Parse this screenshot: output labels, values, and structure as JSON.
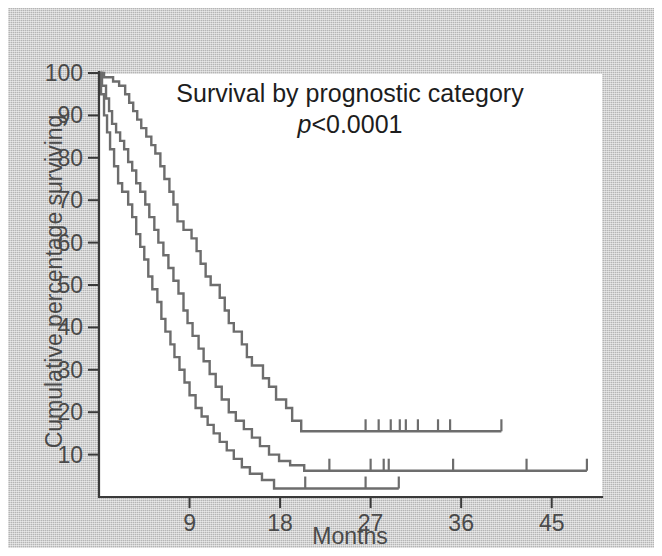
{
  "figure": {
    "background_color": "#b5b5b5",
    "plot_background_color": "#ffffff",
    "curve_color": "#6d6d6d",
    "axis_color": "#3a3a3a"
  },
  "title": {
    "line1": "Survival by prognostic category",
    "p_symbol": "p",
    "p_value": "<0.0001"
  },
  "axes": {
    "x_label": "Months",
    "y_label": "Cumulative percentage surviving",
    "x_ticks": [
      9,
      18,
      27,
      36,
      45
    ],
    "x_tick_labels": [
      "9",
      "18",
      "27",
      "36",
      "45"
    ],
    "y_ticks": [
      10,
      20,
      30,
      40,
      50,
      60,
      70,
      80,
      90,
      100
    ],
    "y_tick_labels": [
      "10",
      "20",
      "30",
      "40",
      "50",
      "60",
      "70",
      "80",
      "90",
      "100"
    ],
    "xlim": [
      0,
      50
    ],
    "ylim": [
      0,
      100
    ]
  },
  "chart_data": {
    "type": "line",
    "title": "Survival by prognostic category",
    "subtitle": "p<0.0001",
    "xlabel": "Months",
    "ylabel": "Cumulative percentage surviving",
    "xlim": [
      0,
      50
    ],
    "ylim": [
      0,
      100
    ],
    "x_ticks": [
      9,
      18,
      27,
      36,
      45
    ],
    "y_ticks": [
      10,
      20,
      30,
      40,
      50,
      60,
      70,
      80,
      90,
      100
    ],
    "grid": false,
    "legend": "none",
    "annotation": "p<0.0001",
    "series": [
      {
        "name": "Good prognostic category",
        "style": "kaplan-meier step",
        "points": [
          [
            0,
            100
          ],
          [
            0.5,
            100
          ],
          [
            0.5,
            99
          ],
          [
            1.4,
            99
          ],
          [
            1.4,
            98
          ],
          [
            2.0,
            98
          ],
          [
            2.0,
            97
          ],
          [
            2.6,
            97
          ],
          [
            2.6,
            95
          ],
          [
            3.0,
            95
          ],
          [
            3.0,
            93
          ],
          [
            3.4,
            93
          ],
          [
            3.4,
            91
          ],
          [
            3.8,
            91
          ],
          [
            3.8,
            89
          ],
          [
            4.2,
            89
          ],
          [
            4.2,
            87
          ],
          [
            4.7,
            87
          ],
          [
            4.7,
            85
          ],
          [
            5.2,
            85
          ],
          [
            5.2,
            83
          ],
          [
            5.6,
            83
          ],
          [
            5.6,
            81
          ],
          [
            6.1,
            81
          ],
          [
            6.1,
            78
          ],
          [
            6.5,
            78
          ],
          [
            6.5,
            75
          ],
          [
            7.0,
            75
          ],
          [
            7.0,
            72
          ],
          [
            7.4,
            72
          ],
          [
            7.4,
            69
          ],
          [
            7.8,
            69
          ],
          [
            7.8,
            65
          ],
          [
            8.4,
            65
          ],
          [
            8.4,
            63
          ],
          [
            9.2,
            63
          ],
          [
            9.2,
            61
          ],
          [
            9.7,
            61
          ],
          [
            9.7,
            58
          ],
          [
            10.1,
            58
          ],
          [
            10.1,
            55
          ],
          [
            10.6,
            55
          ],
          [
            10.6,
            52
          ],
          [
            11.1,
            52
          ],
          [
            11.1,
            50
          ],
          [
            12.0,
            50
          ],
          [
            12.0,
            47
          ],
          [
            12.5,
            47
          ],
          [
            12.5,
            44
          ],
          [
            12.9,
            44
          ],
          [
            12.9,
            41
          ],
          [
            13.4,
            41
          ],
          [
            13.4,
            39
          ],
          [
            14.2,
            39
          ],
          [
            14.2,
            36
          ],
          [
            14.7,
            36
          ],
          [
            14.7,
            33
          ],
          [
            15.2,
            33
          ],
          [
            15.2,
            31
          ],
          [
            16.3,
            31
          ],
          [
            16.3,
            28
          ],
          [
            16.9,
            28
          ],
          [
            16.9,
            26
          ],
          [
            17.6,
            26
          ],
          [
            17.6,
            23
          ],
          [
            18.6,
            23
          ],
          [
            18.6,
            21
          ],
          [
            19.2,
            21
          ],
          [
            19.2,
            18
          ],
          [
            20.1,
            18
          ],
          [
            20.1,
            15.5
          ],
          [
            40.0,
            15.5
          ]
        ],
        "censor_marks": [
          26.5,
          27.8,
          29.0,
          29.9,
          30.5,
          31.7,
          33.7,
          34.9,
          40.0
        ],
        "plateau_value": 15.5,
        "end_month": 40.0
      },
      {
        "name": "Intermediate prognostic category",
        "style": "kaplan-meier step",
        "points": [
          [
            0,
            100
          ],
          [
            0.3,
            100
          ],
          [
            0.3,
            97
          ],
          [
            0.7,
            97
          ],
          [
            0.7,
            94
          ],
          [
            1.0,
            94
          ],
          [
            1.0,
            91
          ],
          [
            1.3,
            91
          ],
          [
            1.3,
            88
          ],
          [
            1.7,
            88
          ],
          [
            1.7,
            86
          ],
          [
            2.1,
            86
          ],
          [
            2.1,
            84
          ],
          [
            2.5,
            84
          ],
          [
            2.5,
            82
          ],
          [
            2.9,
            82
          ],
          [
            2.9,
            79
          ],
          [
            3.3,
            79
          ],
          [
            3.3,
            77
          ],
          [
            3.7,
            77
          ],
          [
            3.7,
            74
          ],
          [
            4.1,
            74
          ],
          [
            4.1,
            72
          ],
          [
            4.6,
            72
          ],
          [
            4.6,
            69
          ],
          [
            5.0,
            69
          ],
          [
            5.0,
            66
          ],
          [
            5.5,
            66
          ],
          [
            5.5,
            63
          ],
          [
            5.9,
            63
          ],
          [
            5.9,
            60
          ],
          [
            6.4,
            60
          ],
          [
            6.4,
            57
          ],
          [
            6.9,
            57
          ],
          [
            6.9,
            54
          ],
          [
            7.4,
            54
          ],
          [
            7.4,
            51
          ],
          [
            7.9,
            51
          ],
          [
            7.9,
            48
          ],
          [
            8.4,
            48
          ],
          [
            8.4,
            44
          ],
          [
            8.8,
            44
          ],
          [
            8.8,
            41
          ],
          [
            9.3,
            41
          ],
          [
            9.3,
            38
          ],
          [
            9.9,
            38
          ],
          [
            9.9,
            35
          ],
          [
            10.4,
            35
          ],
          [
            10.4,
            32
          ],
          [
            11.0,
            32
          ],
          [
            11.0,
            29
          ],
          [
            11.6,
            29
          ],
          [
            11.6,
            26
          ],
          [
            12.2,
            26
          ],
          [
            12.2,
            23
          ],
          [
            12.9,
            23
          ],
          [
            12.9,
            20
          ],
          [
            13.6,
            20
          ],
          [
            13.6,
            18
          ],
          [
            14.4,
            18
          ],
          [
            14.4,
            16
          ],
          [
            15.2,
            16
          ],
          [
            15.2,
            14
          ],
          [
            16.0,
            14
          ],
          [
            16.0,
            12
          ],
          [
            16.9,
            12
          ],
          [
            16.9,
            10
          ],
          [
            17.9,
            10
          ],
          [
            17.9,
            8.5
          ],
          [
            19.0,
            8.5
          ],
          [
            19.0,
            7.5
          ],
          [
            20.4,
            7.5
          ],
          [
            20.4,
            6.2
          ],
          [
            48.5,
            6.2
          ]
        ],
        "censor_marks": [
          22.9,
          27.0,
          28.3,
          28.8,
          35.2,
          42.5,
          48.5
        ],
        "plateau_value": 6.2,
        "end_month": 48.5
      },
      {
        "name": "Poor prognostic category",
        "style": "kaplan-meier step",
        "points": [
          [
            0,
            100
          ],
          [
            0.2,
            100
          ],
          [
            0.2,
            95
          ],
          [
            0.5,
            95
          ],
          [
            0.5,
            90
          ],
          [
            0.8,
            90
          ],
          [
            0.8,
            86
          ],
          [
            1.1,
            86
          ],
          [
            1.1,
            82
          ],
          [
            1.5,
            82
          ],
          [
            1.5,
            78
          ],
          [
            1.9,
            78
          ],
          [
            1.9,
            74
          ],
          [
            2.3,
            74
          ],
          [
            2.3,
            72
          ],
          [
            2.9,
            72
          ],
          [
            2.9,
            69
          ],
          [
            3.3,
            69
          ],
          [
            3.3,
            66
          ],
          [
            3.7,
            66
          ],
          [
            3.7,
            62
          ],
          [
            4.1,
            62
          ],
          [
            4.1,
            59
          ],
          [
            4.5,
            59
          ],
          [
            4.5,
            56
          ],
          [
            4.9,
            56
          ],
          [
            4.9,
            52
          ],
          [
            5.3,
            52
          ],
          [
            5.3,
            49
          ],
          [
            5.8,
            49
          ],
          [
            5.8,
            46
          ],
          [
            6.2,
            46
          ],
          [
            6.2,
            42
          ],
          [
            6.6,
            42
          ],
          [
            6.6,
            39
          ],
          [
            7.1,
            39
          ],
          [
            7.1,
            36
          ],
          [
            7.5,
            36
          ],
          [
            7.5,
            33
          ],
          [
            8.0,
            33
          ],
          [
            8.0,
            30
          ],
          [
            8.5,
            30
          ],
          [
            8.5,
            27
          ],
          [
            9.0,
            27
          ],
          [
            9.0,
            24
          ],
          [
            9.6,
            24
          ],
          [
            9.6,
            21
          ],
          [
            10.2,
            21
          ],
          [
            10.2,
            19
          ],
          [
            10.8,
            19
          ],
          [
            10.8,
            17
          ],
          [
            11.4,
            17
          ],
          [
            11.4,
            15
          ],
          [
            12.0,
            15
          ],
          [
            12.0,
            13
          ],
          [
            12.7,
            13
          ],
          [
            12.7,
            11
          ],
          [
            13.4,
            11
          ],
          [
            13.4,
            9
          ],
          [
            14.2,
            9
          ],
          [
            14.2,
            7
          ],
          [
            15.0,
            7
          ],
          [
            15.0,
            5.5
          ],
          [
            16.2,
            5.5
          ],
          [
            16.2,
            4.0
          ],
          [
            17.4,
            4.0
          ],
          [
            17.4,
            2.0
          ],
          [
            29.8,
            2.0
          ]
        ],
        "censor_marks": [
          20.5,
          26.5,
          29.8
        ],
        "plateau_value": 2.0,
        "end_month": 29.8
      }
    ]
  }
}
